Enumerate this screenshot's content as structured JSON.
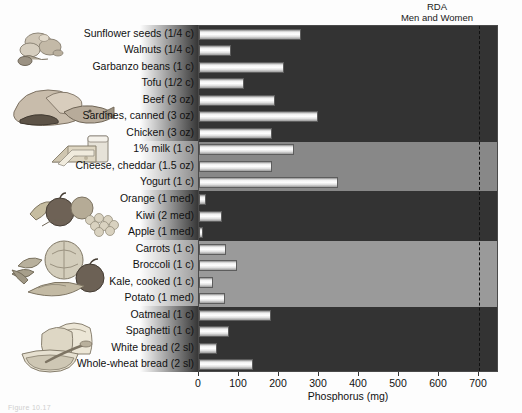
{
  "figure": {
    "rda_label_line1": "RDA",
    "rda_label_line2": "Men and Women",
    "caption": "Figure 10.17"
  },
  "chart_data": {
    "type": "bar",
    "orientation": "horizontal",
    "title": "",
    "xlabel": "Phosphorus (mg)",
    "ylabel": "",
    "xlim": [
      0,
      750
    ],
    "xticks": [
      0,
      100,
      200,
      300,
      400,
      500,
      600,
      700
    ],
    "xticklabels": [
      "0",
      "100",
      "200",
      "300",
      "400",
      "500",
      "600",
      "700"
    ],
    "grid": false,
    "legend": "none",
    "annotations": [
      {
        "type": "vline",
        "value": 700,
        "style": "dashed",
        "label": "RDA Men and Women"
      }
    ],
    "categories": [
      "Sunflower seeds (1/4 c)",
      "Walnuts (1/4 c)",
      "Garbanzo beans (1 c)",
      "Tofu (1/2 c)",
      "Beef (3 oz)",
      "Sardines, canned (3 oz)",
      "Chicken (3 oz)",
      "1% milk (1 c)",
      "Cheese, cheddar (1.5 oz)",
      "Yogurt (1 c)",
      "Orange (1 med)",
      "Kiwi (2 med)",
      "Apple (1 med)",
      "Carrots (1 c)",
      "Broccoli (1 c)",
      "Kale, cooked (1 c)",
      "Potato (1 med)",
      "Oatmeal (1 c)",
      "Spaghetti (1 c)",
      "White bread (2 sl)",
      "Whole-wheat bread (2 sl)"
    ],
    "values": [
      256,
      80,
      213,
      113,
      190,
      298,
      183,
      238,
      183,
      348,
      18,
      58,
      10,
      68,
      95,
      35,
      66,
      180,
      76,
      45,
      135
    ],
    "groups": [
      {
        "name": "Protein foods",
        "rows": [
          0,
          6
        ],
        "band": "dark"
      },
      {
        "name": "Dairy",
        "rows": [
          7,
          9
        ],
        "band": "mid"
      },
      {
        "name": "Fruits",
        "rows": [
          10,
          12
        ],
        "band": "dark"
      },
      {
        "name": "Vegetables",
        "rows": [
          13,
          16
        ],
        "band": "light"
      },
      {
        "name": "Grains",
        "rows": [
          17,
          20
        ],
        "band": "dark"
      }
    ]
  },
  "colors": {
    "band_dark": "#333333",
    "band_mid": "#888888",
    "band_light": "#9a9a9a",
    "bar_light": "#ffffff",
    "bar_edge": "#5d5d5d",
    "rda_line": "#111111",
    "text": "#111111"
  },
  "artwork": [
    {
      "name": "nuts-and-seeds-illustration"
    },
    {
      "name": "meat-and-fish-illustration"
    },
    {
      "name": "cheese-and-milk-illustration"
    },
    {
      "name": "fruit-basket-illustration"
    },
    {
      "name": "vegetables-illustration"
    },
    {
      "name": "bread-and-cereal-illustration"
    }
  ]
}
